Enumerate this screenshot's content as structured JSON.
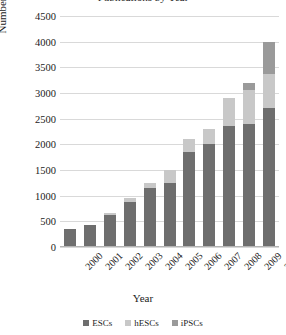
{
  "chart_data": {
    "type": "bar",
    "stacked": true,
    "title": "Publications by Year",
    "xlabel": "Year",
    "ylabel": "Number of Publications",
    "categories": [
      "2000",
      "2001",
      "2002",
      "2003",
      "2004",
      "2005",
      "2006",
      "2007",
      "2008",
      "2009",
      "2010"
    ],
    "series": [
      {
        "name": "ESCs",
        "color": "#6e6e6e",
        "values": [
          350,
          420,
          620,
          880,
          1150,
          1250,
          1850,
          2000,
          2350,
          2400,
          2700
        ]
      },
      {
        "name": "hESCs",
        "color": "#c8c8c8",
        "values": [
          0,
          0,
          50,
          70,
          100,
          250,
          250,
          300,
          550,
          650,
          680
        ]
      },
      {
        "name": "iPSCs",
        "color": "#9a9a9a",
        "values": [
          0,
          0,
          0,
          0,
          0,
          0,
          0,
          0,
          0,
          150,
          620
        ]
      }
    ],
    "totals": [
      350,
      420,
      670,
      950,
      1250,
      1500,
      2100,
      2300,
      2900,
      3200,
      4000
    ],
    "ylim": [
      0,
      4500
    ],
    "ytick_step": 500,
    "yticks": [
      "4500",
      "4000",
      "3500",
      "3000",
      "2500",
      "2000",
      "1500",
      "1000",
      "500",
      "0"
    ],
    "grid": true,
    "legend_position": "bottom",
    "xtick_rotation": -45
  }
}
